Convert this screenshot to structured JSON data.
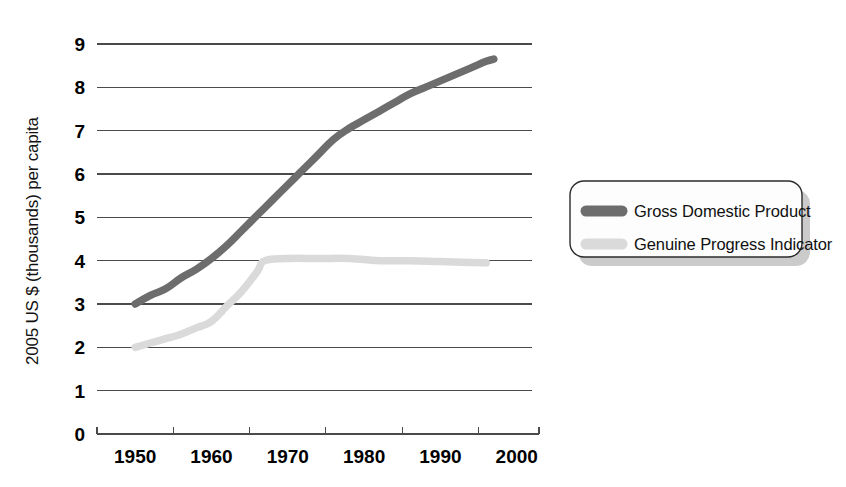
{
  "chart_data": {
    "type": "line",
    "title": "",
    "subtitle": "",
    "xlabel": "",
    "ylabel": "2005 US $ (thousands) per capita",
    "xlim": [
      1945,
      2002
    ],
    "ylim": [
      0,
      9
    ],
    "grid": true,
    "grid_axis": "y",
    "legend_position": "right",
    "y_ticks": [
      "0",
      "1",
      "2",
      "3",
      "4",
      "5",
      "6",
      "7",
      "8",
      "9"
    ],
    "y_tick_values": [
      0,
      1,
      2,
      3,
      4,
      5,
      6,
      7,
      8,
      9
    ],
    "x_ticks": [
      "1950",
      "1960",
      "1970",
      "1980",
      "1990",
      "2000"
    ],
    "x_tick_values": [
      1950,
      1960,
      1970,
      1980,
      1990,
      2000
    ],
    "series": [
      {
        "name": "Gross Domestic Product",
        "color": "#6d6d6d",
        "x": [
          1950,
          1952,
          1954,
          1956,
          1958,
          1960,
          1962,
          1964,
          1966,
          1968,
          1970,
          1972,
          1974,
          1976,
          1978,
          1980,
          1982,
          1984,
          1986,
          1988,
          1990,
          1992,
          1994,
          1996,
          1997
        ],
        "values": [
          3.0,
          3.2,
          3.35,
          3.6,
          3.8,
          4.05,
          4.35,
          4.7,
          5.05,
          5.4,
          5.75,
          6.1,
          6.45,
          6.8,
          7.05,
          7.25,
          7.45,
          7.65,
          7.85,
          8.0,
          8.15,
          8.3,
          8.45,
          8.6,
          8.65
        ]
      },
      {
        "name": "Genuine Progress Indicator",
        "color": "#dadada",
        "x": [
          1950,
          1952,
          1954,
          1956,
          1958,
          1960,
          1962,
          1964,
          1966,
          1967,
          1970,
          1974,
          1978,
          1982,
          1986,
          1990,
          1994,
          1996
        ],
        "values": [
          2.0,
          2.1,
          2.2,
          2.3,
          2.45,
          2.6,
          2.95,
          3.3,
          3.75,
          4.0,
          4.05,
          4.05,
          4.05,
          4.0,
          4.0,
          3.98,
          3.96,
          3.95
        ]
      }
    ]
  },
  "legend": {
    "entries": [
      {
        "label": "Gross Domestic Product",
        "color": "#6d6d6d"
      },
      {
        "label": "Genuine Progress Indicator",
        "color": "#dadada"
      }
    ]
  }
}
